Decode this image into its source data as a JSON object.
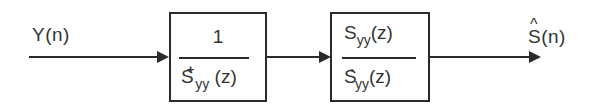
{
  "diagram": {
    "type": "block-diagram",
    "input": {
      "label": "Y(n)"
    },
    "blocks": [
      {
        "id": "prewhitening-filter",
        "numerator": "1",
        "denominator": {
          "base": "S",
          "superscript": "+",
          "subscript": "yy",
          "arg": "(z)"
        }
      },
      {
        "id": "causal-part-filter",
        "numerator": {
          "base": "S",
          "subscript": "yy",
          "arg": "(z)"
        },
        "denominator": {
          "base": "S",
          "superscript": "-",
          "subscript": "yy",
          "arg": "(z)"
        }
      }
    ],
    "output": {
      "label": "S(n)",
      "base": "S",
      "accent": "^",
      "arg": "(n)"
    },
    "connections": [
      {
        "from": "input",
        "to": "prewhitening-filter"
      },
      {
        "from": "prewhitening-filter",
        "to": "causal-part-filter"
      },
      {
        "from": "causal-part-filter",
        "to": "output"
      }
    ],
    "colors": {
      "stroke": "#2b2b2b",
      "text": "#333333",
      "background": "#ffffff"
    }
  }
}
